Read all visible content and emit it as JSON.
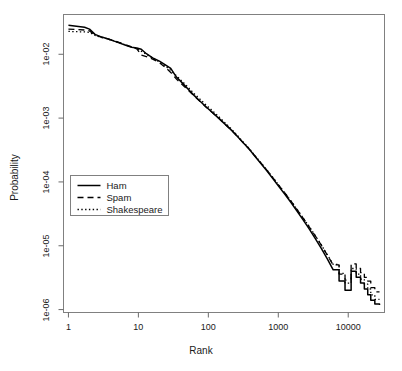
{
  "chart_data": {
    "type": "line",
    "title": "",
    "subtitle": "",
    "xlabel": "Rank",
    "ylabel": "Probability",
    "xscale": "log",
    "yscale": "log",
    "xlim": [
      0.85,
      33000
    ],
    "ylim": [
      9e-07,
      0.042
    ],
    "grid": false,
    "legend_position": "left-middle",
    "xticks": [
      1,
      10,
      100,
      1000,
      10000
    ],
    "xtick_labels": [
      "1",
      "10",
      "100",
      "1000",
      "10000"
    ],
    "yticks": [
      0.01,
      0.001,
      0.0001,
      1e-05,
      1e-06
    ],
    "ytick_labels": [
      "1e-02",
      "1e-03",
      "1e-04",
      "1e-05",
      "1e-06"
    ],
    "annotations": [],
    "series": [
      {
        "name": "Ham",
        "linestyle": "solid",
        "color": "#000000",
        "x": [
          1,
          1.3,
          1.7,
          2,
          2.4,
          3,
          3.6,
          4.4,
          5.4,
          6.6,
          8,
          9.5,
          11,
          13,
          16,
          20,
          24,
          29,
          35,
          43,
          52,
          63,
          77,
          94,
          115,
          140,
          170,
          210,
          255,
          310,
          380,
          460,
          560,
          690,
          840,
          1020,
          1250,
          1520,
          1850,
          2250,
          2750,
          3350,
          4100,
          5000,
          6100,
          7400,
          9000,
          11000,
          13000,
          15000,
          17000,
          19000,
          21000,
          24000,
          28000
        ],
        "y": [
          0.0285,
          0.0275,
          0.0265,
          0.0248,
          0.0205,
          0.0186,
          0.0175,
          0.0162,
          0.015,
          0.0138,
          0.0129,
          0.0125,
          0.012,
          0.0102,
          0.0088,
          0.0078,
          0.0069,
          0.006,
          0.0044,
          0.0035,
          0.0028,
          0.00225,
          0.00182,
          0.00148,
          0.00122,
          0.001,
          0.00082,
          0.00066,
          0.00053,
          0.00042,
          0.00033,
          0.000255,
          0.000196,
          0.000148,
          0.000112,
          8.45e-05,
          6.35e-05,
          4.75e-05,
          3.5e-05,
          2.56e-05,
          1.85e-05,
          1.32e-05,
          9.2e-06,
          6.3e-06,
          4.2e-06,
          2.8e-06,
          2e-06,
          4e-06,
          3.2e-06,
          2.6e-06,
          2.1e-06,
          1.7e-06,
          1.4e-06,
          1.22e-06,
          1.18e-06
        ]
      },
      {
        "name": "Spam",
        "linestyle": "dashed",
        "color": "#000000",
        "x": [
          1,
          1.3,
          1.7,
          2,
          2.4,
          3,
          3.6,
          4.4,
          5.4,
          6.6,
          8,
          9.5,
          11,
          13,
          16,
          20,
          24,
          29,
          35,
          43,
          52,
          63,
          77,
          94,
          115,
          140,
          170,
          210,
          255,
          310,
          380,
          460,
          560,
          690,
          840,
          1020,
          1250,
          1520,
          1850,
          2250,
          2750,
          3350,
          4100,
          5000,
          6100,
          7400,
          9000,
          11000,
          13000,
          15000,
          17000,
          19000,
          21000,
          24000,
          28000
        ],
        "y": [
          0.0248,
          0.0245,
          0.024,
          0.0232,
          0.02,
          0.0184,
          0.0176,
          0.0164,
          0.0152,
          0.0141,
          0.0131,
          0.0122,
          0.0097,
          0.0092,
          0.0084,
          0.0074,
          0.0063,
          0.0052,
          0.0041,
          0.0033,
          0.0027,
          0.00222,
          0.0018,
          0.00147,
          0.00121,
          0.001,
          0.00082,
          0.00066,
          0.00053,
          0.00042,
          0.00033,
          0.000258,
          0.0002,
          0.000152,
          0.000116,
          8.8e-05,
          6.65e-05,
          5e-05,
          3.72e-05,
          2.74e-05,
          2e-05,
          1.45e-05,
          1.03e-05,
          7.2e-06,
          5e-06,
          3.6e-06,
          2.9e-06,
          5.2e-06,
          4.4e-06,
          3.8e-06,
          3.2e-06,
          2.8e-06,
          2.2e-06,
          1.9e-06,
          1.9e-06
        ]
      },
      {
        "name": "Shakespeare",
        "linestyle": "dotted",
        "color": "#000000",
        "x": [
          1,
          1.3,
          1.7,
          2,
          2.4,
          3,
          3.6,
          4.4,
          5.4,
          6.6,
          8,
          9.5,
          11,
          13,
          16,
          20,
          24,
          29,
          35,
          43,
          52,
          63,
          77,
          94,
          115,
          140,
          170,
          210,
          255,
          310,
          380,
          460,
          560,
          690,
          840,
          1020,
          1250,
          1520,
          1850,
          2250,
          2750,
          3350,
          4100,
          5000,
          6100,
          7400,
          9000,
          11000,
          13000,
          15000,
          17000,
          19000,
          21000,
          24000,
          28000
        ],
        "y": [
          0.0228,
          0.0226,
          0.0224,
          0.022,
          0.0198,
          0.0183,
          0.0174,
          0.0163,
          0.0151,
          0.014,
          0.013,
          0.0124,
          0.0112,
          0.01,
          0.0087,
          0.0076,
          0.0066,
          0.0056,
          0.0046,
          0.0037,
          0.003,
          0.0024,
          0.00195,
          0.00158,
          0.0013,
          0.00106,
          0.00086,
          0.00069,
          0.00055,
          0.00043,
          0.00034,
          0.000262,
          0.000202,
          0.000153,
          0.000117,
          8.85e-05,
          6.68e-05,
          5.02e-05,
          3.74e-05,
          2.76e-05,
          2.02e-05,
          1.46e-05,
          1.04e-05,
          7.3e-06,
          5.1e-06,
          3.7e-06,
          2.6e-06,
          4.4e-06,
          3.6e-06,
          3e-06,
          2.5e-06,
          2.1e-06,
          1.7e-06,
          1.45e-06,
          1.45e-06
        ]
      }
    ],
    "legend": [
      {
        "label": "Ham",
        "linestyle": "solid"
      },
      {
        "label": "Spam",
        "linestyle": "dashed"
      },
      {
        "label": "Shakespeare",
        "linestyle": "dotted"
      }
    ]
  }
}
